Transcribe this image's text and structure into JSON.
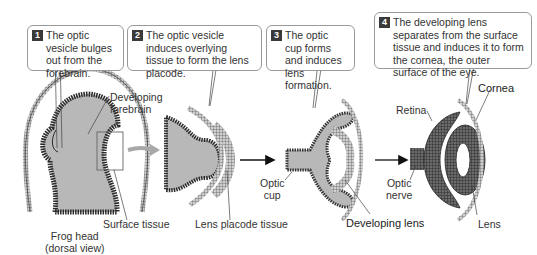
{
  "steps": [
    {
      "number": "1",
      "text": "The optic vesicle bulges out from the forebrain."
    },
    {
      "number": "2",
      "text": "The optic vesicle induces overlying tissue to form the lens placode."
    },
    {
      "number": "3",
      "text": "The optic cup forms and induces lens formation."
    },
    {
      "number": "4",
      "text": "The developing lens separates from the surface tissue and induces it to form the cornea, the outer surface of the eye."
    }
  ],
  "labels": {
    "developing_forebrain": "Developing forebrain",
    "surface_tissue": "Surface tissue",
    "frog_head_line1": "Frog head",
    "frog_head_line2": "(dorsal view)",
    "lens_placode_tissue": "Lens placode tissue",
    "optic_cup_line1": "Optic",
    "optic_cup_line2": "cup",
    "developing_lens": "Developing lens",
    "retina": "Retina",
    "optic_nerve_line1": "Optic",
    "optic_nerve_line2": "nerve",
    "cornea": "Cornea",
    "lens": "Lens"
  },
  "colors": {
    "tissue_fill": "#b8b8b8",
    "tissue_dark": "#3a3a3a",
    "badge": "#3a3a3a",
    "callout_border": "#9a9a9a",
    "zoom_arrow": "#a8a8a8"
  }
}
